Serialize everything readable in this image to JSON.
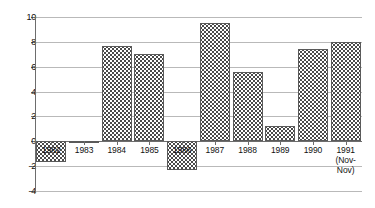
{
  "chart_data": {
    "type": "bar",
    "title": "",
    "subtitle": "",
    "xlabel": "",
    "ylabel": "",
    "categories": [
      "1982",
      "1983",
      "1984",
      "1985",
      "1986",
      "1987",
      "1988",
      "1989",
      "1990",
      "1991"
    ],
    "category_annotations": [
      "",
      "",
      "",
      "",
      "",
      "",
      "",
      "",
      "",
      "(Nov-Nov)"
    ],
    "values": [
      -1.7,
      -0.15,
      7.7,
      7.0,
      -2.3,
      9.5,
      5.6,
      1.2,
      7.4,
      8.0
    ],
    "series": [
      {
        "name": "",
        "values": [
          -1.7,
          -0.15,
          7.7,
          7.0,
          -2.3,
          9.5,
          5.6,
          1.2,
          7.4,
          8.0
        ]
      }
    ],
    "ylim": [
      -4,
      10
    ],
    "ytick_labels": [
      "10",
      "8",
      "6",
      "4",
      "2",
      "0",
      "-2",
      "-4"
    ],
    "ytick_values": [
      10,
      8,
      6,
      4,
      2,
      0,
      -2,
      -4
    ],
    "grid": true,
    "grid_axis": "y",
    "legend": false,
    "legend_position": "none",
    "bar_fill": "dotted-pattern",
    "colors": {
      "bar_outline": "#5a5a5a",
      "bar_pattern": "#4a4a4a",
      "bar_background": "#ffffff",
      "gridline": "#b9b9b9",
      "axis": "#6d6d6d",
      "text": "#111111",
      "plot_background": "#ffffff"
    }
  },
  "yticks": [
    {
      "label": "10",
      "value": 10
    },
    {
      "label": "8",
      "value": 8
    },
    {
      "label": "6",
      "value": 6
    },
    {
      "label": "4",
      "value": 4
    },
    {
      "label": "2",
      "value": 2
    },
    {
      "label": "0",
      "value": 0
    },
    {
      "label": "-2",
      "value": -2
    },
    {
      "label": "-4",
      "value": -4
    }
  ],
  "bars": [
    {
      "label": "1982",
      "sub": "",
      "value": -1.7
    },
    {
      "label": "1983",
      "sub": "",
      "value": -0.15
    },
    {
      "label": "1984",
      "sub": "",
      "value": 7.7
    },
    {
      "label": "1985",
      "sub": "",
      "value": 7.0
    },
    {
      "label": "1986",
      "sub": "",
      "value": -2.3
    },
    {
      "label": "1987",
      "sub": "",
      "value": 9.5
    },
    {
      "label": "1988",
      "sub": "",
      "value": 5.6
    },
    {
      "label": "1989",
      "sub": "",
      "value": 1.2
    },
    {
      "label": "1990",
      "sub": "",
      "value": 7.4
    },
    {
      "label": "1991",
      "sub": "(Nov-\nNov)",
      "value": 8.0
    }
  ]
}
